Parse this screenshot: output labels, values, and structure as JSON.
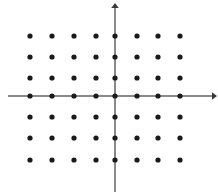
{
  "figure": {
    "name": "coordinate-plane-lattice",
    "width": 218,
    "height": 196,
    "background_color": "#ffffff",
    "title": "",
    "caption": ""
  },
  "axes": {
    "x_axis": {
      "label": "",
      "color": "#8a8a8a",
      "stroke_width": 2,
      "x_start": 8,
      "x_end": 212,
      "y": 96,
      "arrow_end": "right",
      "arrow_size": 5,
      "arrow_color": "#3a3a3a"
    },
    "y_axis": {
      "label": "",
      "color": "#8a8a8a",
      "stroke_width": 2,
      "y_start": 8,
      "y_end": 192,
      "x": 115,
      "arrow_end": "top",
      "arrow_size": 5,
      "arrow_color": "#3a3a3a"
    },
    "origin": {
      "x": 115,
      "y": 96
    },
    "tick_labels_x": [],
    "tick_labels_y": []
  },
  "chart_data": {
    "type": "scatter",
    "title": "",
    "subtitle": "",
    "xlabel": "",
    "ylabel": "",
    "grid": false,
    "legend": [],
    "legend_position": "none",
    "annotations": [],
    "dot_color": "#1a1a1a",
    "dot_radius": 2.6,
    "columns": 8,
    "rows": 7,
    "spacing_px": 22,
    "x_pixels": [
      30,
      52,
      74,
      96,
      115,
      137,
      158,
      180
    ],
    "y_pixels": [
      36,
      57,
      78,
      96,
      117,
      138,
      160
    ],
    "x": [
      -4,
      -3,
      -2,
      -1,
      0,
      1,
      2,
      3
    ],
    "y": [
      3,
      2,
      1,
      0,
      -1,
      -2,
      -3
    ],
    "xlim": [
      -5,
      4
    ],
    "ylim": [
      -4,
      4
    ],
    "points": [
      {
        "x": -4,
        "y": 3
      },
      {
        "x": -3,
        "y": 3
      },
      {
        "x": -2,
        "y": 3
      },
      {
        "x": -1,
        "y": 3
      },
      {
        "x": 0,
        "y": 3
      },
      {
        "x": 1,
        "y": 3
      },
      {
        "x": 2,
        "y": 3
      },
      {
        "x": 3,
        "y": 3
      },
      {
        "x": -4,
        "y": 2
      },
      {
        "x": -3,
        "y": 2
      },
      {
        "x": -2,
        "y": 2
      },
      {
        "x": -1,
        "y": 2
      },
      {
        "x": 0,
        "y": 2
      },
      {
        "x": 1,
        "y": 2
      },
      {
        "x": 2,
        "y": 2
      },
      {
        "x": 3,
        "y": 2
      },
      {
        "x": -4,
        "y": 1
      },
      {
        "x": -3,
        "y": 1
      },
      {
        "x": -2,
        "y": 1
      },
      {
        "x": -1,
        "y": 1
      },
      {
        "x": 0,
        "y": 1
      },
      {
        "x": 1,
        "y": 1
      },
      {
        "x": 2,
        "y": 1
      },
      {
        "x": 3,
        "y": 1
      },
      {
        "x": -4,
        "y": 0
      },
      {
        "x": -3,
        "y": 0
      },
      {
        "x": -2,
        "y": 0
      },
      {
        "x": -1,
        "y": 0
      },
      {
        "x": 0,
        "y": 0
      },
      {
        "x": 1,
        "y": 0
      },
      {
        "x": 2,
        "y": 0
      },
      {
        "x": 3,
        "y": 0
      },
      {
        "x": -4,
        "y": -1
      },
      {
        "x": -3,
        "y": -1
      },
      {
        "x": -2,
        "y": -1
      },
      {
        "x": -1,
        "y": -1
      },
      {
        "x": 0,
        "y": -1
      },
      {
        "x": 1,
        "y": -1
      },
      {
        "x": 2,
        "y": -1
      },
      {
        "x": 3,
        "y": -1
      },
      {
        "x": -4,
        "y": -2
      },
      {
        "x": -3,
        "y": -2
      },
      {
        "x": -2,
        "y": -2
      },
      {
        "x": -1,
        "y": -2
      },
      {
        "x": 0,
        "y": -2
      },
      {
        "x": 1,
        "y": -2
      },
      {
        "x": 2,
        "y": -2
      },
      {
        "x": 3,
        "y": -2
      },
      {
        "x": -4,
        "y": -3
      },
      {
        "x": -3,
        "y": -3
      },
      {
        "x": -2,
        "y": -3
      },
      {
        "x": -1,
        "y": -3
      },
      {
        "x": 0,
        "y": -3
      },
      {
        "x": 1,
        "y": -3
      },
      {
        "x": 2,
        "y": -3
      },
      {
        "x": 3,
        "y": -3
      }
    ],
    "point_count": 56
  }
}
